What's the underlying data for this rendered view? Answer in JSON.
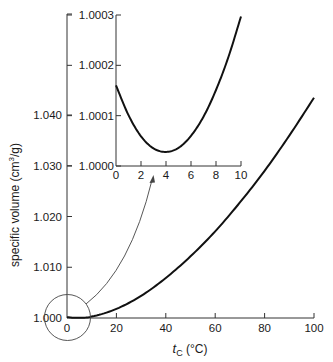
{
  "chart_data": [
    {
      "name": "main",
      "type": "line",
      "title": "",
      "xlabel": "t_C (°C)",
      "xlabel_parts": {
        "var": "t",
        "sub": "C",
        "unit": " (°C)"
      },
      "ylabel": "specific volume (cm³/g)",
      "ylabel_parts": {
        "text": "specific volume (cm",
        "sup": "3",
        "tail": "/g)"
      },
      "xlim": [
        0,
        100
      ],
      "ylim": [
        1.0,
        1.05
      ],
      "x_ticks": [
        0,
        20,
        40,
        60,
        80,
        100
      ],
      "x_tick_labels": [
        "0",
        "20",
        "40",
        "60",
        "80",
        "100"
      ],
      "y_ticks": [
        1.0,
        1.01,
        1.02,
        1.03,
        1.04
      ],
      "y_tick_labels": [
        "1.000",
        "1.010",
        "1.020",
        "1.030",
        "1.040"
      ],
      "grid": false,
      "legend": null,
      "series": [
        {
          "name": "water specific volume",
          "x": [
            0,
            4,
            10,
            20,
            30,
            40,
            50,
            60,
            70,
            80,
            90,
            100
          ],
          "y": [
            1.00016,
            1.00003,
            1.0003,
            1.0018,
            1.00436,
            1.00789,
            1.01215,
            1.01708,
            1.02276,
            1.029,
            1.03594,
            1.0434
          ]
        }
      ],
      "annotations": [
        {
          "type": "circle",
          "label": "zoom region around 0–10 °C near 1.000"
        },
        {
          "type": "arrow",
          "from": "circle",
          "to": "inset"
        }
      ]
    },
    {
      "name": "inset",
      "type": "line",
      "title": "",
      "xlabel": "",
      "ylabel": "",
      "xlim": [
        0,
        10
      ],
      "ylim": [
        1.0,
        1.0003
      ],
      "x_ticks": [
        0,
        2,
        4,
        6,
        8,
        10
      ],
      "x_tick_labels": [
        "0",
        "2",
        "4",
        "6",
        "8",
        "10"
      ],
      "y_ticks": [
        1.0,
        1.0001,
        1.0002,
        1.0003
      ],
      "y_tick_labels": [
        "1.0000",
        "1.0001",
        "1.0002",
        "1.0003"
      ],
      "grid": false,
      "legend": null,
      "series": [
        {
          "name": "water specific volume (detail)",
          "x": [
            0,
            1,
            2,
            3,
            4,
            5,
            6,
            7,
            8,
            9,
            10
          ],
          "y": [
            1.00016,
            1.000101,
            1.000059,
            1.000035,
            1.000028,
            1.000036,
            1.00006,
            1.000098,
            1.000151,
            1.000217,
            1.000297
          ]
        }
      ]
    }
  ],
  "colors": {
    "curve": "#111111",
    "axis": "#333333",
    "arrow": "#444444",
    "background": "#ffffff"
  }
}
